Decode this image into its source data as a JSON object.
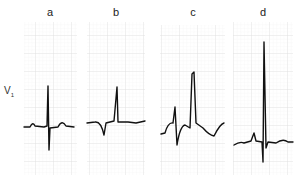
{
  "figure": {
    "lead_label": "V",
    "lead_subscript": "1",
    "panels": [
      {
        "id": "a",
        "label": "a",
        "x": 24,
        "y": 22,
        "w": 53,
        "h": 153
      },
      {
        "id": "b",
        "label": "b",
        "x": 87,
        "y": 22,
        "w": 58,
        "h": 153
      },
      {
        "id": "c",
        "label": "c",
        "x": 160,
        "y": 25,
        "w": 65,
        "h": 150
      },
      {
        "id": "d",
        "label": "d",
        "x": 233,
        "y": 22,
        "w": 60,
        "h": 153
      }
    ],
    "colors": {
      "grid_minor": "#eeeeee",
      "grid_major": "#d8d8d8",
      "trace": "#111111"
    }
  }
}
